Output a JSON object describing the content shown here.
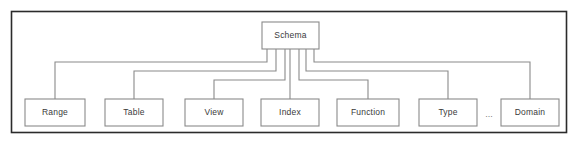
{
  "diagram": {
    "type": "tree-hierarchy",
    "frame": {
      "name": "diagram-border",
      "x": 11.5,
      "y": 11.5,
      "width": 555,
      "height": 121,
      "stroke": "#2b2b2b",
      "fill": "#ffffff"
    },
    "colors": {
      "frame_stroke": "#2b2b2b",
      "node_stroke": "#8a8a8a",
      "node_fill": "#ffffff",
      "edge_stroke": "#8a8a8a",
      "label_text": "#3a3a3a",
      "ellipsis_text": "#7d7d7d",
      "background": "#ffffff"
    },
    "root": {
      "id": "schema",
      "label": "Schema",
      "x": 262,
      "y": 22,
      "width": 57,
      "height": 27
    },
    "children": [
      {
        "id": "range",
        "label": "Range",
        "x": 25,
        "y": 99,
        "width": 60,
        "height": 27,
        "stub_x": 267,
        "bus_y": 62,
        "drop_x": 55
      },
      {
        "id": "table",
        "label": "Table",
        "x": 105,
        "y": 99,
        "width": 58,
        "height": 27,
        "stub_x": 276,
        "bus_y": 71,
        "drop_x": 134
      },
      {
        "id": "view",
        "label": "View",
        "x": 185,
        "y": 99,
        "width": 58,
        "height": 27,
        "stub_x": 285,
        "bus_y": 80,
        "drop_x": 214
      },
      {
        "id": "index",
        "label": "Index",
        "x": 261,
        "y": 99,
        "width": 58,
        "height": 27,
        "stub_x": 290,
        "bus_y": 99,
        "drop_x": 290
      },
      {
        "id": "function",
        "label": "Function",
        "x": 337,
        "y": 99,
        "width": 62,
        "height": 27,
        "stub_x": 299,
        "bus_y": 80,
        "drop_x": 368
      },
      {
        "id": "type",
        "label": "Type",
        "x": 419,
        "y": 99,
        "width": 58,
        "height": 27,
        "stub_x": 306,
        "bus_y": 71,
        "drop_x": 448
      },
      {
        "id": "domain",
        "label": "Domain",
        "x": 501,
        "y": 99,
        "width": 58,
        "height": 27,
        "stub_x": 314,
        "bus_y": 62,
        "drop_x": 530
      }
    ],
    "ellipsis": {
      "id": "ellipsis-between-type-and-domain",
      "label": "...",
      "x": 489,
      "y": 115
    }
  }
}
